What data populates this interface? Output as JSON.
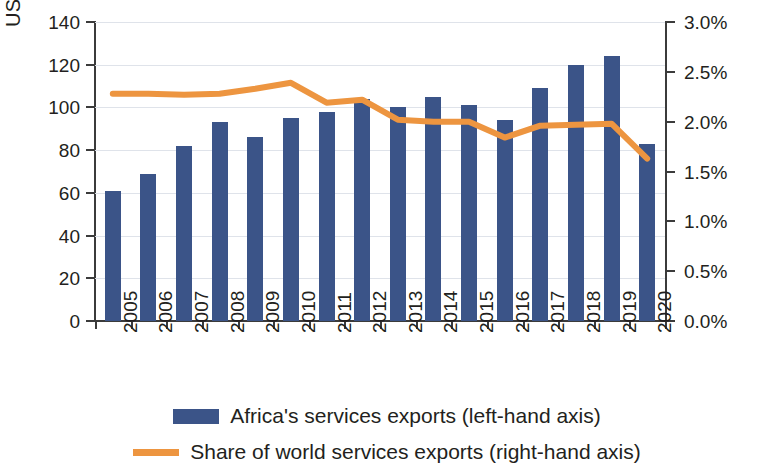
{
  "chart_data": {
    "type": "bar",
    "title": "",
    "subtitle": "",
    "xlabel": "",
    "ylabel": "US $ billions",
    "ylabel_right": "",
    "categories": [
      "2005",
      "2006",
      "2007",
      "2008",
      "2009",
      "2010",
      "2011",
      "2012",
      "2013",
      "2014",
      "2015",
      "2016",
      "2017",
      "2018",
      "2019",
      "2020"
    ],
    "ylim": [
      0,
      140
    ],
    "ylim_right": [
      0,
      3.0
    ],
    "ytick_labels": [
      "0",
      "20",
      "40",
      "60",
      "80",
      "100",
      "120",
      "140"
    ],
    "ytick_values": [
      0,
      20,
      40,
      60,
      80,
      100,
      120,
      140
    ],
    "ytick_labels_right": [
      "0.0%",
      "0.5%",
      "1.0%",
      "1.5%",
      "2.0%",
      "2.5%",
      "3.0%"
    ],
    "ytick_values_right": [
      0,
      0.5,
      1.0,
      1.5,
      2.0,
      2.5,
      3.0
    ],
    "grid": true,
    "legend_position": "bottom",
    "colors": {
      "bar": "#3b5488",
      "line": "#ed9540",
      "grid": "#dfe3ea",
      "axis": "#3b3b3b",
      "text": "#231f20"
    },
    "series": [
      {
        "name": "Africa's services exports (left-hand axis)",
        "type": "bar",
        "axis": "left",
        "color": "#3b5488",
        "values": [
          61,
          69,
          82,
          93,
          86,
          95,
          98,
          104,
          100,
          105,
          101,
          94,
          109,
          120,
          124,
          83
        ]
      },
      {
        "name": "Share of world services exports (right-hand axis)",
        "type": "line",
        "axis": "right",
        "color": "#ed9540",
        "values": [
          2.28,
          2.28,
          2.27,
          2.28,
          2.33,
          2.39,
          2.19,
          2.22,
          2.02,
          2.0,
          2.0,
          1.84,
          1.96,
          1.97,
          1.98,
          1.63
        ]
      }
    ]
  },
  "legend": {
    "items": [
      {
        "label": "Africa's services exports (left-hand axis)",
        "marker": "bar-swatch"
      },
      {
        "label": "Share of world services exports (right-hand axis)",
        "marker": "line-swatch"
      }
    ]
  }
}
